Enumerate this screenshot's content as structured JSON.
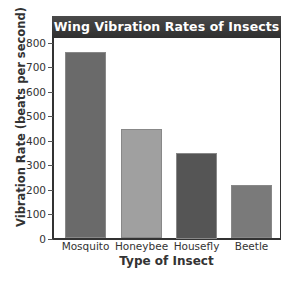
{
  "chart_data": {
    "type": "bar",
    "title": "Wing Vibration Rates of Insects",
    "xlabel": "Type of Insect",
    "ylabel": "Vibration Rate (beats per second)",
    "categories": [
      "Mosquito",
      "Honeybee",
      "Housefly",
      "Beetle"
    ],
    "values": [
      760,
      445,
      350,
      220
    ],
    "ylim": [
      0,
      800
    ],
    "yticks": [
      0,
      100,
      200,
      300,
      400,
      500,
      600,
      700,
      800
    ],
    "grid": false,
    "legend": null,
    "bar_colors": [
      "#6a6a6a",
      "#a0a0a0",
      "#555555",
      "#7a7a7a"
    ]
  },
  "labels": {
    "title": "Wing Vibration Rates of Insects",
    "xlabel": "Type of Insect",
    "ylabel": "Vibration Rate (beats per second)",
    "categories": [
      "Mosquito",
      "Honeybee",
      "Housefly",
      "Beetle"
    ],
    "yticks": [
      "0",
      "100",
      "200",
      "300",
      "400",
      "500",
      "600",
      "700",
      "800"
    ]
  }
}
